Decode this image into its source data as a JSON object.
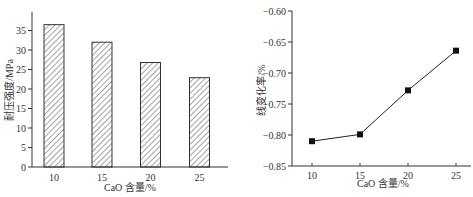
{
  "chart_data": [
    {
      "type": "bar",
      "title": "",
      "xlabel": "CaO 含量/%",
      "ylabel": "耐压强度/MPa",
      "categories": [
        "10",
        "15",
        "20",
        "25"
      ],
      "values": [
        36.5,
        32.0,
        26.8,
        22.9
      ],
      "ylim": [
        0,
        38
      ],
      "yticks": [
        "0",
        "5",
        "10",
        "15",
        "20",
        "25",
        "30",
        "35"
      ],
      "grid": false,
      "bar_fill": "hatched",
      "legend": null
    },
    {
      "type": "line",
      "title": "",
      "xlabel": "CaO 含量/%",
      "ylabel": "线变化率/%",
      "x": [
        10,
        15,
        20,
        25
      ],
      "values": [
        -0.81,
        -0.799,
        -0.728,
        -0.664
      ],
      "ylim": [
        -0.85,
        -0.6
      ],
      "yticks": [
        "-0.85",
        "-0.80",
        "-0.75",
        "-0.70",
        "-0.65",
        "-0.60"
      ],
      "xticks": [
        "10",
        "15",
        "20",
        "25"
      ],
      "marker": "square",
      "grid": false,
      "legend": null
    }
  ]
}
